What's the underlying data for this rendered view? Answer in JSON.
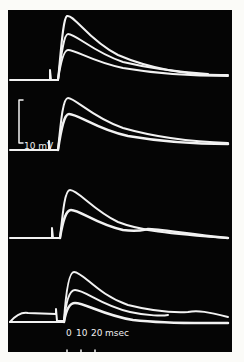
{
  "figure": {
    "background": "#050505",
    "trace_color": "#f2f2f2",
    "voltage_scale": {
      "label": "10 mV"
    },
    "time_scale": {
      "ticks": [
        "0",
        "10",
        "20"
      ],
      "unit": "msec"
    },
    "panels": [
      {
        "id": 1,
        "n_traces": 3
      },
      {
        "id": 2,
        "n_traces": 2
      },
      {
        "id": 3,
        "n_traces": 2
      },
      {
        "id": 4,
        "n_traces": 3
      }
    ]
  }
}
